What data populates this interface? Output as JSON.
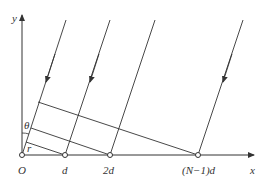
{
  "diagram": {
    "axes": {
      "x_label": "x",
      "y_label": "y",
      "origin_label": "O"
    },
    "points": [
      {
        "label": "O",
        "x": 22
      },
      {
        "label": "d",
        "x": 65
      },
      {
        "label": "2d",
        "x": 110
      },
      {
        "label": "(N−1)d",
        "x": 198
      }
    ],
    "angle_labels": {
      "theta": "θ",
      "r": "r"
    },
    "colors": {
      "line": "#333333",
      "background": "#ffffff"
    }
  }
}
